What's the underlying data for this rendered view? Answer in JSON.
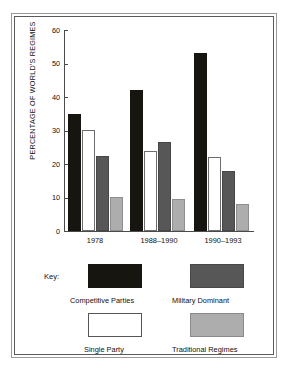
{
  "chart_data": {
    "type": "bar",
    "title": "",
    "xlabel": "",
    "ylabel": "PERCENTAGE OF WORLD'S REGIMES",
    "ylim": [
      0,
      60
    ],
    "yticks": [
      0,
      10,
      20,
      30,
      40,
      50,
      60
    ],
    "grid": false,
    "legend_position": "bottom",
    "legend_title": "Key:",
    "categories": [
      "1978",
      "1988–1990",
      "1990–1993"
    ],
    "series": [
      {
        "name": "Competitive Parties",
        "color": "#17150f",
        "values": [
          35,
          42,
          53
        ]
      },
      {
        "name": "Single Party",
        "color": "#ffffff",
        "values": [
          30,
          24,
          22
        ]
      },
      {
        "name": "Military Dominant",
        "color": "#575757",
        "values": [
          22.5,
          26.5,
          18
        ]
      },
      {
        "name": "Traditional Regimes",
        "color": "#adadad",
        "values": [
          10,
          9.5,
          8
        ]
      }
    ]
  },
  "axis": {
    "y_label": "PERCENTAGE OF WORLD'S REGIMES",
    "y_ticks": [
      "60",
      "50",
      "40",
      "30",
      "20",
      "10",
      "0"
    ],
    "x_ticks": [
      "1978",
      "1988–1990",
      "1990–1993"
    ]
  },
  "key": {
    "title": "Key:",
    "entries": [
      {
        "label": "Competitive Parties",
        "color": "#17150f"
      },
      {
        "label": "Military Dominant",
        "color": "#575757"
      },
      {
        "label": "Single Party",
        "color": "#ffffff"
      },
      {
        "label": "Traditional Regimes",
        "color": "#adadad"
      }
    ]
  }
}
